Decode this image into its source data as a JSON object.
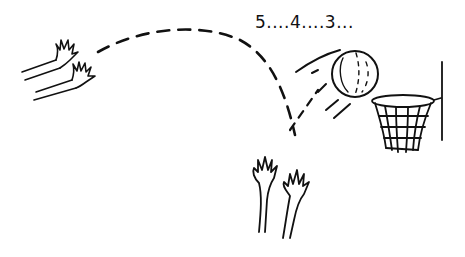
{
  "illustration": {
    "description": "Hand-drawn sketch of a basketball shot: hands release ball, dashed arc trajectory, ball bouncing toward hoop with countdown text, raised hands below",
    "countdown_text": "5....4....3...",
    "ink_color": "#111111",
    "background_color": "#ffffff",
    "elements": [
      "shooting-hands",
      "trajectory-arc",
      "basketball",
      "hoop-with-net",
      "backboard-pole",
      "raised-hands"
    ]
  }
}
